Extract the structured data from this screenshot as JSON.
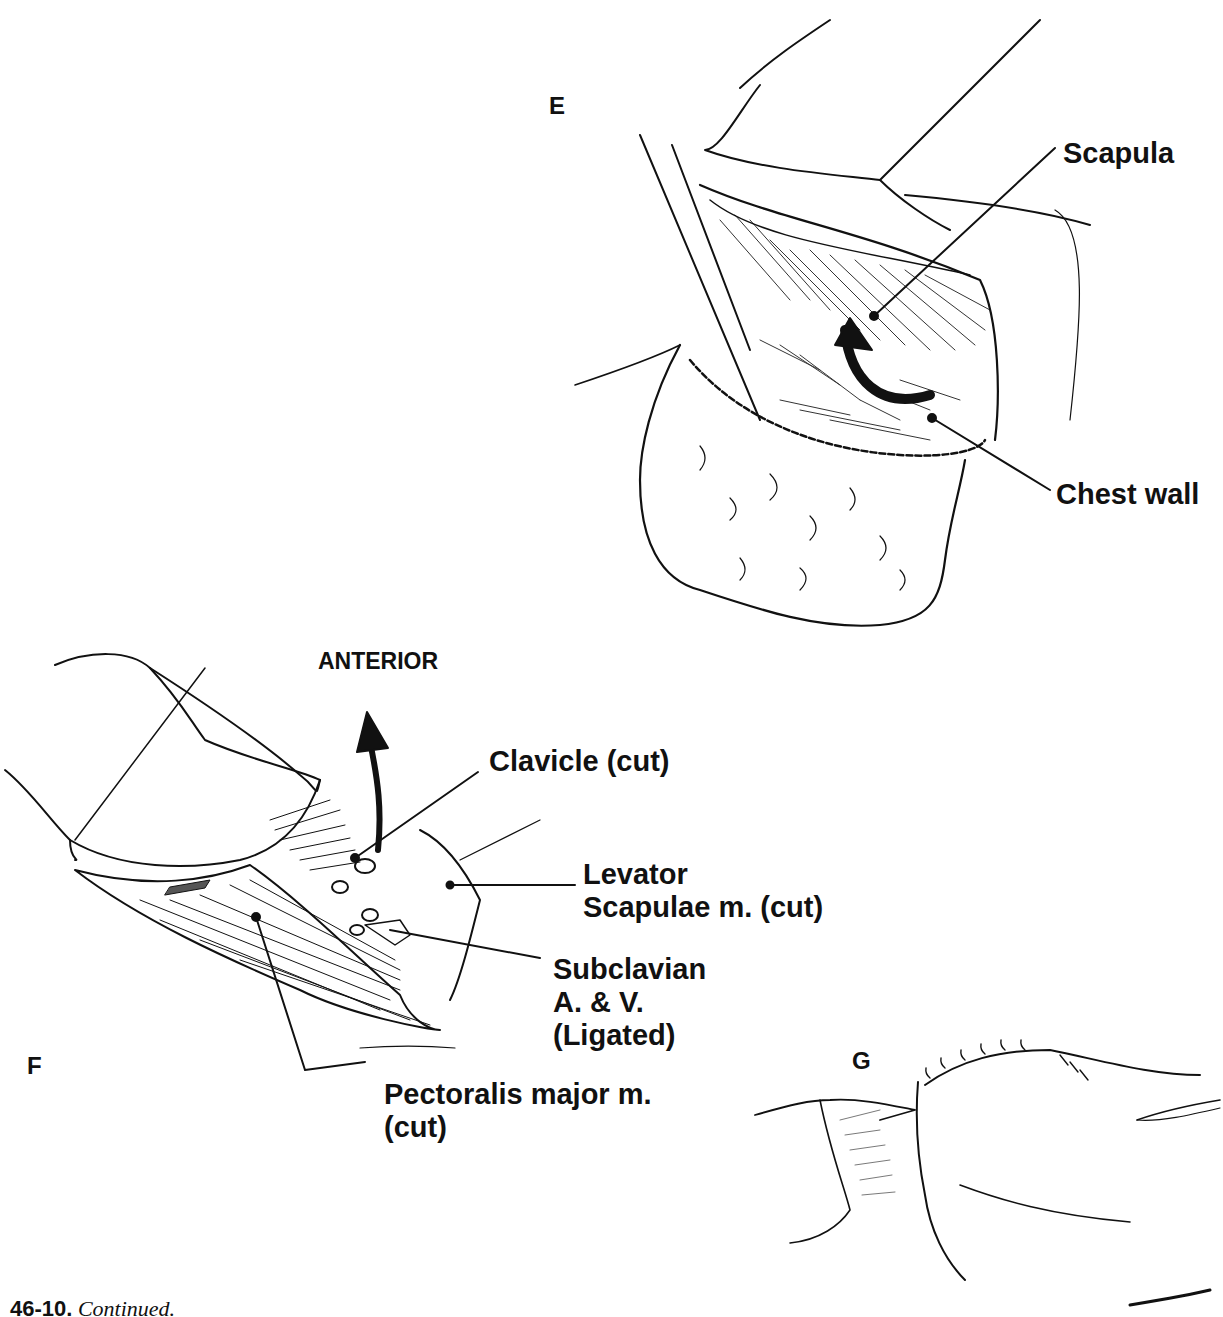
{
  "figure": {
    "caption": {
      "number": "46-10.",
      "text": "Continued."
    },
    "panels": [
      {
        "letter": "E",
        "labels": [
          "Scapula",
          "Chest wall"
        ]
      },
      {
        "letter": "F",
        "direction_label": "ANTERIOR",
        "labels": [
          "Clavicle (cut)",
          "Levator",
          "Scapulae m. (cut)",
          "Subclavian",
          "A. & V.",
          "(Ligated)",
          "Pectoralis major m.",
          "(cut)"
        ]
      },
      {
        "letter": "G",
        "labels": []
      }
    ]
  }
}
